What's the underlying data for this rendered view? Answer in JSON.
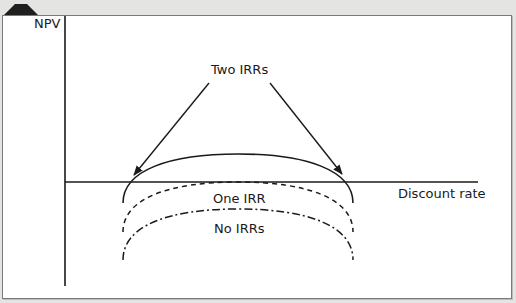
{
  "diagram": {
    "axes": {
      "y_label": "NPV",
      "x_label": "Discount rate"
    },
    "annotations": {
      "two_irrs": "Two IRRs",
      "one_irr": "One IRR",
      "no_irrs": "No IRRs"
    },
    "curves": [
      {
        "name": "two-irrs-curve",
        "style": "solid",
        "crosses_axis": 2
      },
      {
        "name": "one-irr-curve",
        "style": "dashed",
        "crosses_axis": 1
      },
      {
        "name": "no-irrs-curve",
        "style": "dash-dot",
        "crosses_axis": 0
      }
    ],
    "colors": {
      "line": "#1a1a1a",
      "frame": "#7a7a7a",
      "background": "#e4e4e2",
      "panel": "#ffffff"
    }
  }
}
